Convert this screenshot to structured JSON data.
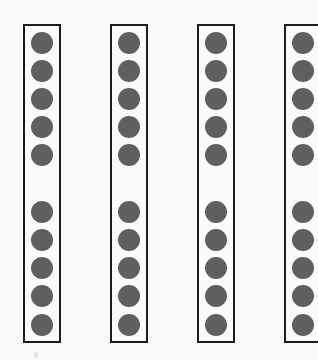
{
  "figure": {
    "colors": {
      "background": "#f9f9f8",
      "frame_border": "#1c1c1c",
      "dot_fill": "#5f5f5f"
    },
    "frames": [
      {
        "id": "frame-1",
        "left": 23,
        "dot_count": 10
      },
      {
        "id": "frame-2",
        "left": 110,
        "dot_count": 10
      },
      {
        "id": "frame-3",
        "left": 197,
        "dot_count": 10
      },
      {
        "id": "frame-4",
        "left": 284,
        "dot_count": 10
      }
    ],
    "dot_centers_y": [
      43,
      71,
      99,
      127,
      155,
      212,
      240,
      268,
      296,
      325
    ],
    "total_dots": 40
  }
}
